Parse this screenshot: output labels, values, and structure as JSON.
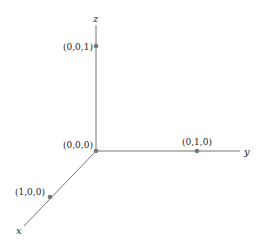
{
  "diagram": {
    "type": "3d-coordinate-axes",
    "colors": {
      "axis": "#777777",
      "point": "#777777",
      "text": "#222222"
    },
    "axes": {
      "x": {
        "label": "x"
      },
      "y": {
        "label": "y"
      },
      "z": {
        "label": "z"
      }
    },
    "points": [
      {
        "label": "(0,0,0)"
      },
      {
        "label": "(0,0,1)"
      },
      {
        "label": "(0,1,0)"
      },
      {
        "label": "(1,0,0)"
      }
    ]
  }
}
